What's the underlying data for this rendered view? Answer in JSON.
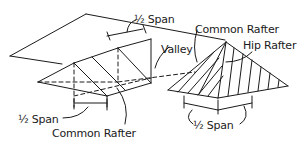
{
  "diagram": {
    "type": "isometric roof framing diagram",
    "labels": {
      "half_span_top": "½ Span",
      "valley": "Valley",
      "common_rafter_top": "Common Rafter",
      "hip_rafter": "Hip Rafter",
      "half_span_left": "½ Span",
      "common_rafter_bottom": "Common Rafter",
      "half_span_right": "½ Span"
    },
    "colors": {
      "line": "#1a1a1a",
      "background": "#ffffff"
    }
  }
}
